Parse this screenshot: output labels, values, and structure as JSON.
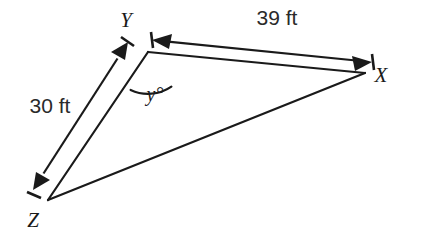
{
  "diagram": {
    "background_color": "#ffffff",
    "stroke_color": "#1a1a1a",
    "vertices": [
      {
        "name": "Y",
        "label": "Y",
        "x": 148,
        "y": 52,
        "label_x": 126,
        "label_y": 27
      },
      {
        "name": "X",
        "label": "X",
        "x": 365,
        "y": 73,
        "label_x": 381,
        "label_y": 82
      },
      {
        "name": "Z",
        "label": "Z",
        "x": 48,
        "y": 200,
        "label_x": 33,
        "label_y": 227
      }
    ],
    "sides": [
      {
        "name": "side-YX",
        "from": "Y",
        "to": "X"
      },
      {
        "name": "side-YZ",
        "from": "Y",
        "to": "Z"
      },
      {
        "name": "side-ZX",
        "from": "Z",
        "to": "X"
      }
    ],
    "measurements": [
      {
        "name": "measure-YX",
        "label": "39 ft",
        "value": 39,
        "unit": "ft",
        "measures_side": "YX",
        "label_x": 277,
        "label_y": 25,
        "start_x": 152,
        "start_y": 40,
        "end_x": 372,
        "end_y": 62
      },
      {
        "name": "measure-YZ",
        "label": "30 ft",
        "value": 30,
        "unit": "ft",
        "measures_side": "YZ",
        "label_x": 50,
        "label_y": 113,
        "start_x": 128,
        "start_y": 42,
        "end_x": 33,
        "end_y": 190
      }
    ],
    "angles": [
      {
        "name": "angle-y",
        "label": "y°",
        "at_vertex": "Y",
        "label_x": 155,
        "label_y": 101
      }
    ]
  }
}
